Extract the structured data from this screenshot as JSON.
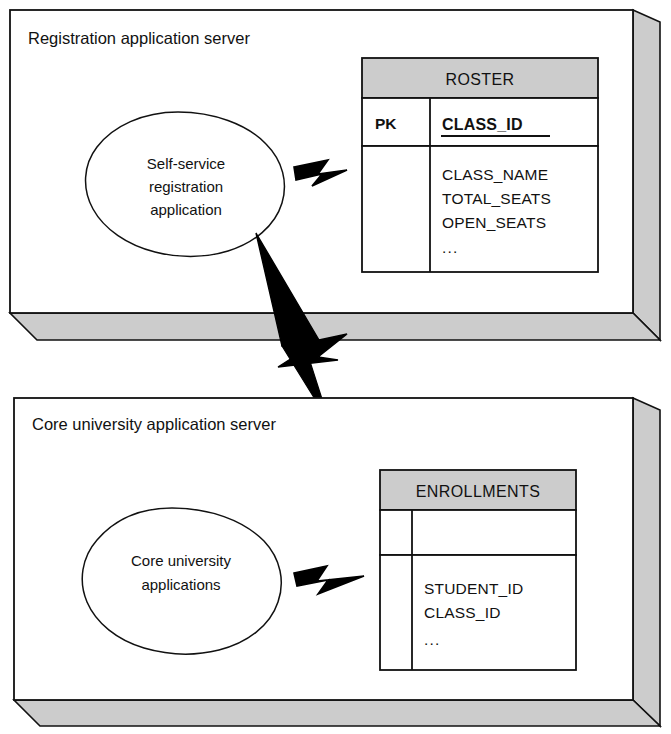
{
  "diagram": {
    "type": "deployment-diagram",
    "colors": {
      "stroke": "#111111",
      "box_face": "#ffffff",
      "box_shade": "#cccccc",
      "table_header_fill": "#cccccc",
      "bolt_fill": "#000000"
    },
    "servers": [
      {
        "id": "registration-server",
        "label": "Registration application server",
        "component": {
          "id": "self-service-app",
          "shape": "ellipse",
          "lines": [
            "Self-service",
            "registration",
            "application"
          ]
        },
        "table": {
          "id": "roster-table",
          "name": "ROSTER",
          "key_column_label": "PK",
          "key_fields": [
            "CLASS_ID"
          ],
          "fields": [
            "CLASS_NAME",
            "TOTAL_SEATS",
            "OPEN_SEATS"
          ],
          "ellipsis": "..."
        },
        "connector": {
          "id": "registration-db-link",
          "shape": "lightning-bolt",
          "from": "self-service-app",
          "to": "roster-table"
        }
      },
      {
        "id": "core-university-server",
        "label": "Core university application server",
        "component": {
          "id": "core-university-app",
          "shape": "ellipse",
          "lines": [
            "Core university",
            "applications"
          ]
        },
        "table": {
          "id": "enrollments-table",
          "name": "ENROLLMENTS",
          "key_column_label": "",
          "key_fields": [],
          "fields": [
            "STUDENT_ID",
            "CLASS_ID"
          ],
          "ellipsis": "..."
        },
        "connector": {
          "id": "core-db-link",
          "shape": "lightning-bolt",
          "from": "core-university-app",
          "to": "enrollments-table"
        }
      }
    ],
    "inter_server_connector": {
      "id": "server-to-server-link",
      "shape": "lightning-bolt",
      "from": "registration-server",
      "to": "core-university-server"
    }
  }
}
